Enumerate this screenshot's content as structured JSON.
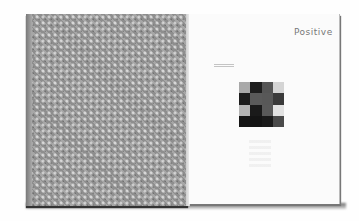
{
  "image": {
    "subject": "open book photographed flat",
    "left_side": {
      "description": "cover with bubble-wrap texture",
      "color": "#9a9a9a"
    },
    "right_page": {
      "title": "Positive",
      "caption_lines": 2,
      "grid": {
        "rows": 4,
        "cols": 4,
        "cells": [
          [
            "#a8a8a8",
            "#1e1e1e",
            "#555555",
            "#d4d4d4"
          ],
          [
            "#1c1c1c",
            "#5a5a5a",
            "#585858",
            "#3a3a3a"
          ],
          [
            "#b4b4b4",
            "#1a1a1a",
            "#595959",
            "#e2e2e2"
          ],
          [
            "#151515",
            "#141414",
            "#1a1a1a",
            "#4a4a4a"
          ]
        ]
      },
      "ghost_print": "faint show-through of grid below"
    }
  }
}
